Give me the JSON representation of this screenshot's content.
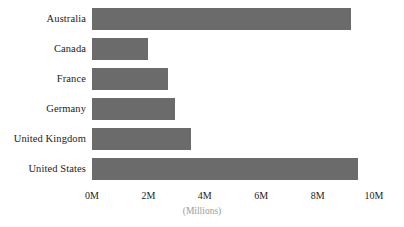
{
  "chart_data": {
    "type": "bar",
    "orientation": "horizontal",
    "title": "",
    "subtitle": "",
    "xlabel": "(Millions)",
    "ylabel": "",
    "categories": [
      "Australia",
      "Canada",
      "France",
      "Germany",
      "United Kingdom",
      "United States"
    ],
    "values": [
      9.2,
      2.0,
      2.7,
      2.95,
      3.5,
      9.45
    ],
    "series": [
      {
        "name": "",
        "values": [
          9.2,
          2.0,
          2.7,
          2.95,
          3.5,
          9.45
        ]
      }
    ],
    "xlim": [
      0,
      10
    ],
    "xticks": [
      0,
      2,
      4,
      6,
      8,
      10
    ],
    "xtick_labels": [
      "0M",
      "2M",
      "4M",
      "6M",
      "8M",
      "10M"
    ],
    "grid": false,
    "legend": false,
    "legend_position": "none",
    "bar_color": "#6b6b6b",
    "background_color": "#ffffff",
    "label_color": "#1c1c1c",
    "axis_title_color": "#9a9a9a"
  }
}
